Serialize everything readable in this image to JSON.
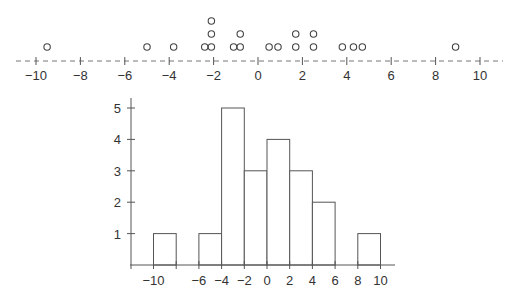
{
  "chart_data": [
    {
      "type": "scatter",
      "subtype": "dot_plot",
      "title": "",
      "xlabel": "",
      "ylabel": "",
      "xlim": [
        -10.5,
        10.8
      ],
      "x_ticks": [
        -10,
        -8,
        -6,
        -4,
        -2,
        0,
        2,
        4,
        6,
        8,
        10
      ],
      "x_tick_labels": [
        "−10",
        "−8",
        "−6",
        "−4",
        "−2",
        "0",
        "2",
        "4",
        "6",
        "8",
        "10"
      ],
      "axis_style": "dashed",
      "marker": "o",
      "grid": false,
      "values": [
        -9.5,
        -5.0,
        -3.8,
        -2.4,
        -2.1,
        -2.1,
        -2.1,
        -1.1,
        -0.8,
        -0.8,
        0.5,
        0.9,
        1.7,
        1.7,
        2.5,
        2.5,
        3.8,
        4.3,
        4.7,
        8.9
      ],
      "stacks": [
        {
          "x": -9.5,
          "count": 1
        },
        {
          "x": -5.0,
          "count": 1
        },
        {
          "x": -3.8,
          "count": 1
        },
        {
          "x": -2.4,
          "count": 1
        },
        {
          "x": -2.1,
          "count": 3
        },
        {
          "x": -1.1,
          "count": 1
        },
        {
          "x": -0.8,
          "count": 2
        },
        {
          "x": 0.5,
          "count": 1
        },
        {
          "x": 0.9,
          "count": 1
        },
        {
          "x": 1.7,
          "count": 2
        },
        {
          "x": 2.5,
          "count": 2
        },
        {
          "x": 3.8,
          "count": 1
        },
        {
          "x": 4.3,
          "count": 1
        },
        {
          "x": 4.7,
          "count": 1
        },
        {
          "x": 8.9,
          "count": 1
        }
      ]
    },
    {
      "type": "bar",
      "subtype": "histogram",
      "title": "",
      "xlabel": "",
      "ylabel": "",
      "bin_edges": [
        -10,
        -8,
        -6,
        -4,
        -2,
        0,
        2,
        4,
        6,
        8,
        10
      ],
      "categories": [
        "[-10,-8)",
        "[-8,-6)",
        "[-6,-4)",
        "[-4,-2)",
        "[-2,0)",
        "[0,2)",
        "[2,4)",
        "[4,6)",
        "[6,8)",
        "[8,10)"
      ],
      "values": [
        1,
        0,
        1,
        5,
        3,
        4,
        3,
        2,
        0,
        1
      ],
      "x_ticks": [
        -10,
        -8,
        -6,
        -4,
        -2,
        0,
        2,
        4,
        6,
        8,
        10
      ],
      "x_tick_labels": [
        "−10",
        "",
        "−6",
        "−4",
        "−2",
        "0",
        "2",
        "4",
        "6",
        "8",
        "10"
      ],
      "y_ticks": [
        1,
        2,
        3,
        4,
        5
      ],
      "y_tick_labels": [
        "1",
        "2",
        "3",
        "4",
        "5"
      ],
      "ylim": [
        0,
        5.3
      ],
      "xlim": [
        -11,
        11.5
      ],
      "grid": false,
      "legend": null
    }
  ]
}
